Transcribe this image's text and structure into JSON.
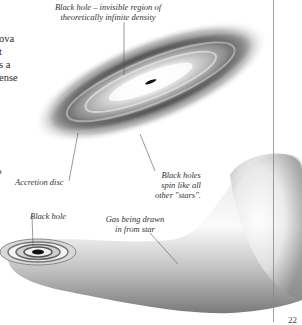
{
  "body_text": {
    "lines": [
      "ova",
      "t",
      "s a",
      "ense"
    ],
    "orphan_mark": "o"
  },
  "labels": {
    "black_hole_top_line1": "Black hole – invisible region of",
    "black_hole_top_line2": "theoretically infinite density",
    "accretion_disc": "Accretion disc",
    "spin_line1": "Black holes",
    "spin_line2": "spin like all",
    "spin_line3": "other \"stars\".",
    "black_hole_bottom": "Black hole",
    "gas_line1": "Gas being drawn",
    "gas_line2": "in from star"
  },
  "page_number": "22",
  "colors": {
    "background": "#ffffff",
    "text": "#2a2a2a",
    "leader_line": "#555555",
    "margin_rule": "#888888"
  }
}
